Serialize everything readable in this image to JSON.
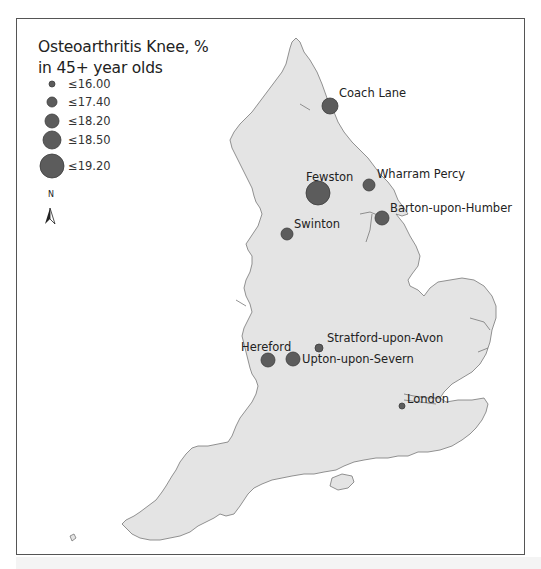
{
  "legend": {
    "title_line1": "Osteoarthritis Knee, %",
    "title_line2": "in 45+ year olds",
    "classes": [
      {
        "label": "≤16.00",
        "radius": 3
      },
      {
        "label": "≤17.40",
        "radius": 5
      },
      {
        "label": "≤18.20",
        "radius": 7
      },
      {
        "label": "≤18.50",
        "radius": 9
      },
      {
        "label": "≤19.20",
        "radius": 12
      }
    ]
  },
  "north_arrow": {
    "label": "N",
    "icon": "north-arrow-icon"
  },
  "colors": {
    "land": "#e4e4e4",
    "coast": "#777777",
    "marker": "#5c5c5c",
    "marker_edge": "#3c3c3c"
  },
  "places": [
    {
      "name": "Coach Lane",
      "class": "≤18.20"
    },
    {
      "name": "Fewston",
      "class": "≤19.20"
    },
    {
      "name": "Wharram Percy",
      "class": "≤17.40"
    },
    {
      "name": "Barton-upon-Humber",
      "class": "≤18.20"
    },
    {
      "name": "Swinton",
      "class": "≤17.40"
    },
    {
      "name": "Stratford-upon-Avon",
      "class": "≤16.00"
    },
    {
      "name": "Hereford",
      "class": "≤18.20"
    },
    {
      "name": "Upton-upon-Severn",
      "class": "≤18.20"
    },
    {
      "name": "London",
      "class": "≤16.00"
    }
  ]
}
